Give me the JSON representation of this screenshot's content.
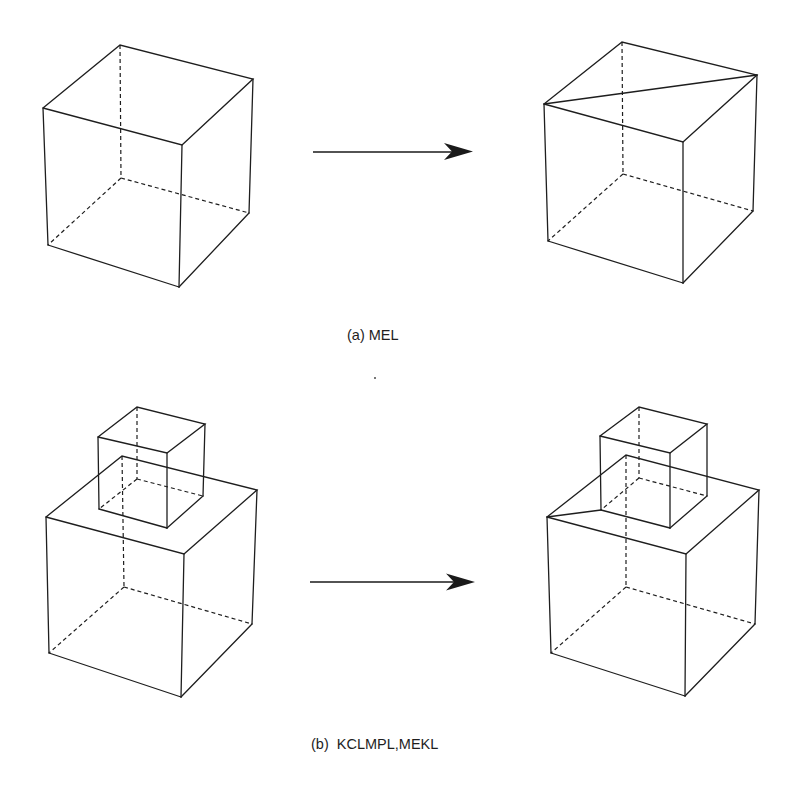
{
  "figure": {
    "panels": [
      {
        "id": "a",
        "caption": "(a) MEL",
        "operation": "MEL",
        "description": "Cube before and after MEL: a diagonal edge is added across the top face",
        "before": {
          "object": "cube"
        },
        "after": {
          "object": "cube",
          "added_edge": "top-face diagonal from left corner to right corner"
        }
      },
      {
        "id": "b",
        "caption": "(b)  KCLMPL,MEKL",
        "operation": "KCLMPL,MEKL",
        "description": "Large cube with smaller cube on top; after operation an edge connects the large cube's top-left corner to the small cube's bottom-left corner",
        "before": {
          "object": "large cube with small cube on top"
        },
        "after": {
          "object": "large cube with small cube on top",
          "added_edge": "large top-left corner to small cube bottom-left corner"
        }
      }
    ],
    "colors": {
      "line": "#1e1e1e",
      "background": "#ffffff"
    }
  }
}
